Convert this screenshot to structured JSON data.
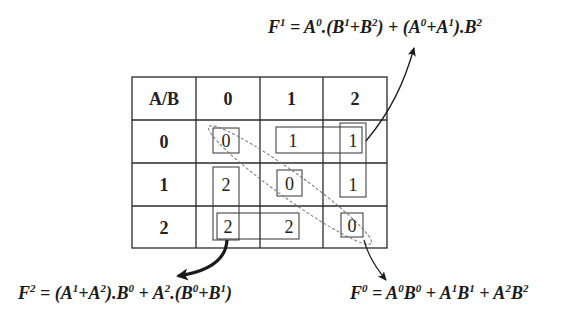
{
  "table": {
    "corner_label": "A/B",
    "column_headers": [
      "0",
      "1",
      "2"
    ],
    "row_headers": [
      "0",
      "1",
      "2"
    ],
    "rows": [
      [
        "0",
        "1",
        "1"
      ],
      [
        "2",
        "0",
        "1"
      ],
      [
        "2",
        "2",
        "0"
      ]
    ]
  },
  "formulas": {
    "f1": {
      "lhs_base": "F",
      "lhs_sup": "1",
      "parts": [
        {
          "t": " = "
        },
        {
          "b": "A",
          "s": "0"
        },
        {
          "t": ".("
        },
        {
          "b": "B",
          "s": "1"
        },
        {
          "t": "+"
        },
        {
          "b": "B",
          "s": "2"
        },
        {
          "t": ") + ("
        },
        {
          "b": "A",
          "s": "0"
        },
        {
          "t": "+"
        },
        {
          "b": "A",
          "s": "1"
        },
        {
          "t": ")."
        },
        {
          "b": "B",
          "s": "2"
        }
      ],
      "text": "F1 = A0.(B1+B2) + (A0+A1).B2"
    },
    "f2": {
      "lhs_base": "F",
      "lhs_sup": "2",
      "parts": [
        {
          "t": " = ("
        },
        {
          "b": "A",
          "s": "1"
        },
        {
          "t": "+"
        },
        {
          "b": "A",
          "s": "2"
        },
        {
          "t": ")."
        },
        {
          "b": "B",
          "s": "0"
        },
        {
          "t": " + "
        },
        {
          "b": "A",
          "s": "2"
        },
        {
          "t": ".("
        },
        {
          "b": "B",
          "s": "0"
        },
        {
          "t": "+"
        },
        {
          "b": "B",
          "s": "1"
        },
        {
          "t": ")"
        }
      ],
      "text": "F2 = (A1+A2).B0 + A2.(B0+B1)"
    },
    "f0": {
      "lhs_base": "F",
      "lhs_sup": "0",
      "parts": [
        {
          "t": " = "
        },
        {
          "b": "A",
          "s": "0"
        },
        {
          "b": "B",
          "s": "0"
        },
        {
          "t": " + "
        },
        {
          "b": "A",
          "s": "1"
        },
        {
          "b": "B",
          "s": "1"
        },
        {
          "t": " + "
        },
        {
          "b": "A",
          "s": "2"
        },
        {
          "b": "B",
          "s": "2"
        }
      ],
      "text": "F0 = A0B0 + A1B1 + A2B2"
    }
  },
  "colors": {
    "line": "#2a2a2a",
    "dashed": "#777777",
    "arrow": "#1a1a1a"
  }
}
